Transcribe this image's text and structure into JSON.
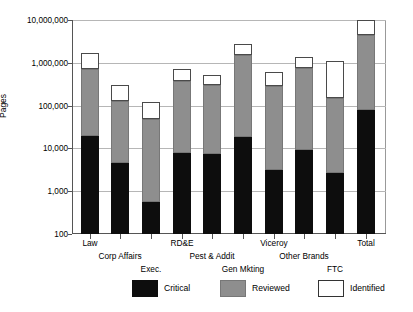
{
  "chart_data": {
    "type": "bar",
    "stacked": true,
    "scale": "log",
    "title": "",
    "xlabel": "",
    "ylabel": "Pages",
    "ylim": [
      100,
      10000000
    ],
    "yticks": [
      100,
      1000,
      10000,
      100000,
      1000000,
      10000000
    ],
    "ytick_labels": [
      "100",
      "1,000",
      "10,000",
      "100,000",
      "1,000,000",
      "10,000,000"
    ],
    "grid": true,
    "legend_position": "bottom",
    "categories": [
      "Law",
      "Corp Affairs",
      "Exec.",
      "RD&E",
      "Pest & Addit",
      "Gen Mkting",
      "Viceroy",
      "Other Brands",
      "FTC",
      "Total"
    ],
    "series": [
      {
        "name": "Critical",
        "color": "#0d0d0d",
        "values": [
          20000,
          4500,
          550,
          8000,
          7500,
          18000,
          3200,
          9000,
          2700,
          80000
        ]
      },
      {
        "name": "Reviewed",
        "color": "#8e8e8e",
        "values": [
          700000,
          130000,
          48000,
          380000,
          300000,
          1500000,
          290000,
          750000,
          150000,
          4500000
        ]
      },
      {
        "name": "Identified",
        "color": "#ffffff",
        "values": [
          1700000,
          300000,
          120000,
          700000,
          520000,
          2800000,
          600000,
          1400000,
          1100000,
          10000000
        ]
      }
    ],
    "bar_geometry": [
      {
        "category": "Law",
        "x_center": 18,
        "critical_top": 20000,
        "reviewed_top": 700000,
        "identified_top": 1700000
      },
      {
        "category": "Corp Affairs",
        "x_center": 48,
        "critical_top": 4500,
        "reviewed_top": 130000,
        "identified_top": 300000
      },
      {
        "category": "Exec.",
        "x_center": 79,
        "critical_top": 550,
        "reviewed_top": 48000,
        "identified_top": 120000
      },
      {
        "category": "RD&E",
        "x_center": 110,
        "critical_top": 8000,
        "reviewed_top": 380000,
        "identified_top": 700000
      },
      {
        "category": "Pest & Addit",
        "x_center": 140,
        "critical_top": 7500,
        "reviewed_top": 300000,
        "identified_top": 520000
      },
      {
        "category": "Gen Mkting",
        "x_center": 171,
        "critical_top": 18000,
        "reviewed_top": 1500000,
        "identified_top": 2800000
      },
      {
        "category": "Viceroy",
        "x_center": 202,
        "critical_top": 3200,
        "reviewed_top": 290000,
        "identified_top": 600000
      },
      {
        "category": "Other Brands",
        "x_center": 232,
        "critical_top": 9000,
        "reviewed_top": 750000,
        "identified_top": 1400000
      },
      {
        "category": "FTC",
        "x_center": 263,
        "critical_top": 2700,
        "reviewed_top": 150000,
        "identified_top": 1100000
      },
      {
        "category": "Total",
        "x_center": 294,
        "critical_top": 80000,
        "reviewed_top": 4500000,
        "identified_top": 10000000
      }
    ],
    "category_label_rows": [
      {
        "label": "Law",
        "row": 0,
        "x_center": 18
      },
      {
        "label": "Corp Affairs",
        "row": 1,
        "x_center": 48
      },
      {
        "label": "Exec.",
        "row": 2,
        "x_center": 79
      },
      {
        "label": "RD&E",
        "row": 0,
        "x_center": 110
      },
      {
        "label": "Pest & Addit",
        "row": 1,
        "x_center": 140
      },
      {
        "label": "Gen Mkting",
        "row": 2,
        "x_center": 171
      },
      {
        "label": "Viceroy",
        "row": 0,
        "x_center": 202
      },
      {
        "label": "Other Brands",
        "row": 1,
        "x_center": 232
      },
      {
        "label": "FTC",
        "row": 2,
        "x_center": 263
      },
      {
        "label": "Total",
        "row": 0,
        "x_center": 294
      }
    ]
  },
  "legend": {
    "items": [
      {
        "label": "Critical",
        "key": "critical",
        "x": 62
      },
      {
        "label": "Reviewed",
        "key": "reviewed",
        "x": 150
      },
      {
        "label": "Identified",
        "key": "identified",
        "x": 248
      }
    ]
  },
  "axis": {
    "y_title": "Pages"
  }
}
